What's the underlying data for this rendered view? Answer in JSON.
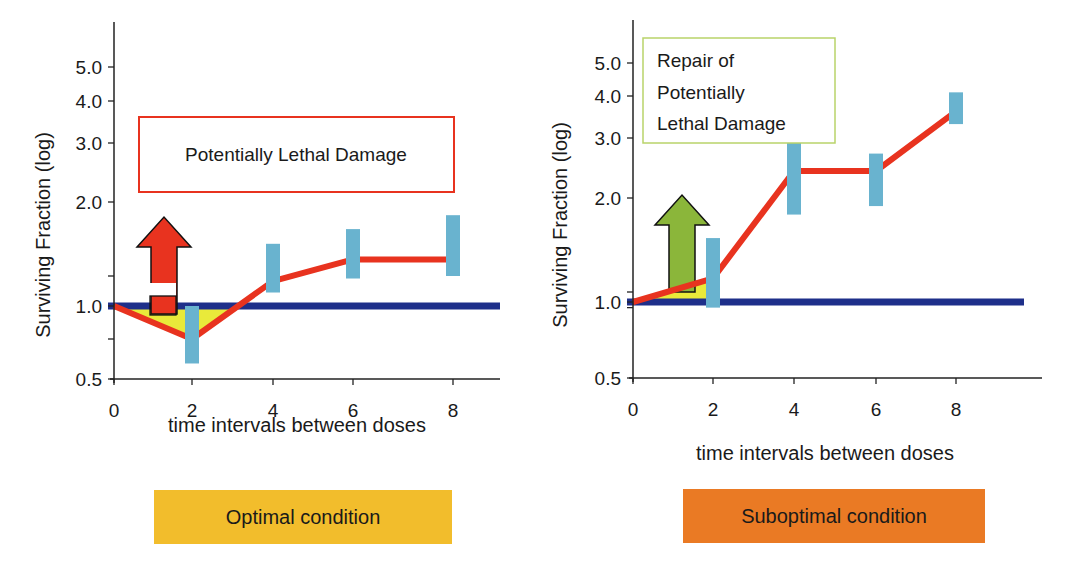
{
  "chart_data": [
    {
      "type": "line",
      "title": "",
      "xlabel": "time intervals between doses",
      "ylabel": "Surviving Fraction (log)",
      "x_ticks": [
        "0",
        "2",
        "4",
        "6",
        "8"
      ],
      "y_ticks": [
        "0.5",
        "1.0",
        "2.0",
        "3.0",
        "4.0",
        "5.0"
      ],
      "ylim": [
        0.5,
        6.0
      ],
      "xlim": [
        0,
        9.5
      ],
      "grid": false,
      "series": [
        {
          "name": "surviving fraction",
          "x": [
            0,
            2,
            4,
            6,
            8
          ],
          "y": [
            1.0,
            0.8,
            1.4,
            1.6,
            1.6
          ],
          "color": "#e8331f"
        },
        {
          "name": "baseline",
          "x": [
            0,
            9.5
          ],
          "y": [
            1.0,
            1.0
          ],
          "color": "#1e2f8a"
        }
      ],
      "error_bars": [
        {
          "x": 2,
          "low": 0.6,
          "high": 1.0
        },
        {
          "x": 4,
          "low": 1.2,
          "high": 1.7
        },
        {
          "x": 6,
          "low": 1.45,
          "high": 1.8
        },
        {
          "x": 8,
          "low": 1.5,
          "high": 1.9
        }
      ],
      "annotation": "Potentially Lethal Damage",
      "arrow_color": "#e8331f",
      "condition_label": "Optimal condition",
      "condition_color": "#f2bd2c"
    },
    {
      "type": "line",
      "title": "",
      "xlabel": "time intervals between doses",
      "ylabel": "Surviving Fraction (log)",
      "x_ticks": [
        "0",
        "2",
        "4",
        "6",
        "8"
      ],
      "y_ticks": [
        "0.5",
        "1.0",
        "2.0",
        "3.0",
        "4.0",
        "5.0"
      ],
      "ylim": [
        0.5,
        6.0
      ],
      "xlim": [
        0,
        9.5
      ],
      "grid": false,
      "series": [
        {
          "name": "surviving fraction",
          "x": [
            0,
            2,
            4,
            6,
            8
          ],
          "y": [
            1.0,
            1.2,
            2.4,
            2.4,
            3.6
          ],
          "color": "#e8331f"
        },
        {
          "name": "baseline",
          "x": [
            0,
            9.5
          ],
          "y": [
            1.0,
            1.0
          ],
          "color": "#1e2f8a"
        }
      ],
      "error_bars": [
        {
          "x": 2,
          "low": 0.95,
          "high": 1.55
        },
        {
          "x": 4,
          "low": 1.8,
          "high": 3.0
        },
        {
          "x": 6,
          "low": 1.9,
          "high": 2.7
        },
        {
          "x": 8,
          "low": 3.3,
          "high": 4.1
        }
      ],
      "annotation": "Repair of\nPotentially\nLethal Damage",
      "annotation_lines": [
        "Repair of",
        "Potentially",
        "Lethal Damage"
      ],
      "arrow_color": "#8bb63a",
      "condition_label": "Suboptimal condition",
      "condition_color": "#ea7a24"
    }
  ]
}
